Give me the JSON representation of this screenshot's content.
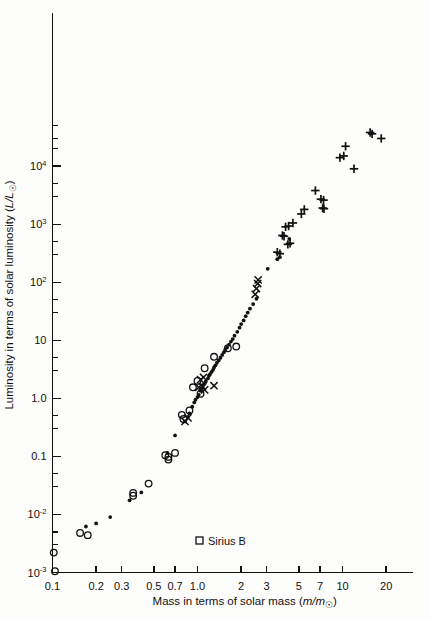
{
  "chart_data": {
    "type": "scatter",
    "title": "",
    "xlabel": "Mass in terms of solar mass (m/m☉)",
    "ylabel": "Luminosity in terms of solar luminosity (L/L☉)",
    "xscale": "log",
    "yscale": "log",
    "xlim": [
      0.1,
      25
    ],
    "ylim": [
      0.001,
      60000
    ],
    "grid": false,
    "legend_position": "inside-bottom-center",
    "xticks": [
      {
        "value": 0.1,
        "label": "0.1"
      },
      {
        "value": 0.2,
        "label": "0.2"
      },
      {
        "value": 0.3,
        "label": "0.3"
      },
      {
        "value": 0.5,
        "label": "0.5"
      },
      {
        "value": 0.7,
        "label": "0.7"
      },
      {
        "value": 1.0,
        "label": "1.0"
      },
      {
        "value": 2,
        "label": "2"
      },
      {
        "value": 3,
        "label": "3"
      },
      {
        "value": 5,
        "label": "5"
      },
      {
        "value": 7,
        "label": "7"
      },
      {
        "value": 10,
        "label": "10"
      },
      {
        "value": 20,
        "label": "20"
      }
    ],
    "yticks": [
      {
        "value": 10000,
        "label": "10",
        "sup": "4"
      },
      {
        "value": 1000,
        "label": "10",
        "sup": "3"
      },
      {
        "value": 100,
        "label": "10",
        "sup": "2"
      },
      {
        "value": 10,
        "label": "10",
        "sup": ""
      },
      {
        "value": 1.0,
        "label": "1.0",
        "sup": ""
      },
      {
        "value": 0.1,
        "label": "0.1",
        "sup": ""
      },
      {
        "value": 0.01,
        "label": "10",
        "sup": "-2"
      },
      {
        "value": 0.001,
        "label": "10",
        "sup": "-3"
      }
    ],
    "yticks_minor": [
      30000,
      3000,
      300,
      30,
      3.0,
      0.3,
      0.03,
      0.003,
      50000,
      5000,
      500,
      50,
      5.0,
      0.5,
      0.05,
      0.005
    ],
    "legend": [
      {
        "marker": "square",
        "label": "Sirius B"
      }
    ],
    "series": [
      {
        "name": "visual-binaries-dot",
        "marker": "dot",
        "points": [
          [
            0.17,
            0.0062
          ],
          [
            0.2,
            0.007
          ],
          [
            0.25,
            0.009
          ],
          [
            0.34,
            0.0175
          ],
          [
            0.41,
            0.024
          ],
          [
            0.62,
            0.115
          ],
          [
            0.7,
            0.23
          ],
          [
            0.82,
            0.4
          ],
          [
            0.86,
            0.48
          ],
          [
            0.88,
            0.55
          ],
          [
            0.92,
            0.72
          ],
          [
            0.95,
            0.85
          ],
          [
            0.97,
            0.95
          ],
          [
            1.0,
            1.05
          ],
          [
            1.02,
            1.15
          ],
          [
            1.05,
            1.35
          ],
          [
            1.06,
            1.45
          ],
          [
            1.08,
            1.55
          ],
          [
            1.1,
            1.7
          ],
          [
            1.12,
            1.8
          ],
          [
            1.14,
            1.95
          ],
          [
            1.18,
            2.2
          ],
          [
            1.2,
            2.45
          ],
          [
            1.22,
            2.6
          ],
          [
            1.25,
            2.85
          ],
          [
            1.28,
            3.1
          ],
          [
            1.3,
            3.4
          ],
          [
            1.33,
            3.7
          ],
          [
            1.36,
            4.1
          ],
          [
            1.4,
            4.5
          ],
          [
            1.44,
            5.0
          ],
          [
            1.48,
            5.6
          ],
          [
            1.52,
            6.2
          ],
          [
            1.55,
            6.8
          ],
          [
            1.6,
            7.5
          ],
          [
            1.65,
            8.4
          ],
          [
            1.7,
            9.5
          ],
          [
            1.75,
            10.5
          ],
          [
            1.8,
            12.0
          ],
          [
            1.88,
            14.0
          ],
          [
            1.95,
            16.5
          ],
          [
            2.0,
            19.0
          ],
          [
            2.08,
            22.0
          ],
          [
            2.15,
            26.0
          ],
          [
            2.22,
            30.0
          ],
          [
            2.3,
            35.0
          ],
          [
            2.42,
            42.0
          ],
          [
            2.55,
            52.0
          ],
          [
            3.05,
            170.0
          ],
          [
            3.55,
            250.0
          ],
          [
            3.7,
            270.0
          ],
          [
            4.3,
            560.0
          ]
        ]
      },
      {
        "name": "spectroscopic-binaries-circle",
        "marker": "circle",
        "points": [
          [
            0.102,
            0.0022
          ],
          [
            0.104,
            0.00105
          ],
          [
            0.155,
            0.0048
          ],
          [
            0.175,
            0.0044
          ],
          [
            0.36,
            0.021
          ],
          [
            0.36,
            0.0235
          ],
          [
            0.46,
            0.034
          ],
          [
            0.6,
            0.105
          ],
          [
            0.63,
            0.098
          ],
          [
            0.63,
            0.088
          ],
          [
            0.7,
            0.115
          ],
          [
            0.78,
            0.52
          ],
          [
            0.8,
            0.44
          ],
          [
            0.88,
            0.62
          ],
          [
            0.93,
            1.55
          ],
          [
            1.0,
            2.0
          ],
          [
            1.05,
            1.2
          ],
          [
            1.12,
            3.3
          ],
          [
            1.3,
            5.2
          ],
          [
            1.62,
            7.3
          ],
          [
            1.85,
            7.8
          ]
        ]
      },
      {
        "name": "eclipsing-binaries-cross",
        "marker": "cross",
        "points": [
          [
            0.82,
            0.4
          ],
          [
            0.86,
            0.46
          ],
          [
            1.02,
            1.55
          ],
          [
            1.08,
            1.6
          ],
          [
            1.12,
            1.4
          ],
          [
            1.05,
            2.1
          ],
          [
            1.1,
            2.3
          ],
          [
            1.3,
            1.65
          ],
          [
            2.5,
            62.0
          ],
          [
            2.55,
            78.0
          ],
          [
            2.6,
            95.0
          ],
          [
            2.62,
            110.0
          ]
        ]
      },
      {
        "name": "massive-stars-plus",
        "marker": "plus",
        "points": [
          [
            3.55,
            330.0
          ],
          [
            3.7,
            310.0
          ],
          [
            3.85,
            640.0
          ],
          [
            3.95,
            620.0
          ],
          [
            4.05,
            900.0
          ],
          [
            4.25,
            930.0
          ],
          [
            4.2,
            450.0
          ],
          [
            4.35,
            470.0
          ],
          [
            4.55,
            1050.0
          ],
          [
            5.2,
            1500.0
          ],
          [
            5.45,
            1800.0
          ],
          [
            6.5,
            3800.0
          ],
          [
            7.1,
            2700.0
          ],
          [
            7.4,
            2600.0
          ],
          [
            7.3,
            1900.0
          ],
          [
            7.45,
            1850.0
          ],
          [
            9.6,
            14000.0
          ],
          [
            10.2,
            15000.0
          ],
          [
            10.5,
            22000.0
          ],
          [
            12.0,
            9000.0
          ],
          [
            15.5,
            38000.0
          ],
          [
            16.0,
            36000.0
          ],
          [
            18.5,
            30000.0
          ]
        ]
      },
      {
        "name": "sirius-b-white-dwarf",
        "marker": "square",
        "points": []
      }
    ]
  },
  "legend_label": "Sirius B"
}
